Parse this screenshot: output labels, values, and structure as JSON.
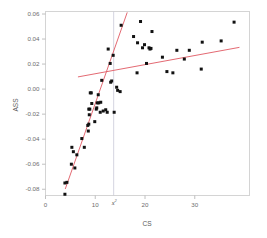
{
  "chart_data": {
    "type": "scatter",
    "title": "",
    "subtitle": "",
    "xlabel": "CS",
    "ylabel": "ASS",
    "xlim": [
      0,
      41
    ],
    "ylim": [
      -0.085,
      0.062
    ],
    "xticks": [
      0,
      10,
      20,
      30
    ],
    "xtick_labels": [
      "0",
      "10",
      "20",
      "30"
    ],
    "yticks": [
      0.06,
      0.04,
      0.02,
      0.0,
      -0.02,
      -0.04,
      -0.06,
      -0.08
    ],
    "ytick_labels": [
      "0.06",
      "0.04",
      "0.02",
      "0.00",
      "-0.02",
      "-0.04",
      "-0.06",
      "-0.08"
    ],
    "grid": false,
    "legend": null,
    "marker": {
      "shape": "square",
      "color": "#111111",
      "size": 3.0
    },
    "points": [
      {
        "x": 3.9,
        "y": -0.084
      },
      {
        "x": 3.9,
        "y": -0.075
      },
      {
        "x": 4.3,
        "y": -0.0745
      },
      {
        "x": 5.2,
        "y": -0.06
      },
      {
        "x": 5.3,
        "y": -0.0465
      },
      {
        "x": 5.6,
        "y": -0.05
      },
      {
        "x": 5.9,
        "y": -0.063
      },
      {
        "x": 6.3,
        "y": -0.0525
      },
      {
        "x": 7.3,
        "y": -0.0395
      },
      {
        "x": 7.8,
        "y": -0.0465
      },
      {
        "x": 8.5,
        "y": -0.029
      },
      {
        "x": 8.6,
        "y": -0.0335
      },
      {
        "x": 8.7,
        "y": -0.028
      },
      {
        "x": 8.7,
        "y": -0.016
      },
      {
        "x": 8.8,
        "y": -0.0205
      },
      {
        "x": 8.9,
        "y": -0.016
      },
      {
        "x": 9.0,
        "y": -0.003
      },
      {
        "x": 9.2,
        "y": -0.003
      },
      {
        "x": 9.3,
        "y": -0.0115
      },
      {
        "x": 9.9,
        "y": -0.026
      },
      {
        "x": 10.2,
        "y": -0.016
      },
      {
        "x": 10.3,
        "y": -0.015
      },
      {
        "x": 10.4,
        "y": -0.011
      },
      {
        "x": 10.6,
        "y": -0.0045
      },
      {
        "x": 10.7,
        "y": -0.011
      },
      {
        "x": 11.0,
        "y": -0.0185
      },
      {
        "x": 11.1,
        "y": -0.0105
      },
      {
        "x": 11.3,
        "y": 0.007
      },
      {
        "x": 11.6,
        "y": -0.0175
      },
      {
        "x": 12.1,
        "y": -0.0165
      },
      {
        "x": 12.4,
        "y": -0.0185
      },
      {
        "x": 12.6,
        "y": 0.032
      },
      {
        "x": 13.0,
        "y": 0.0205
      },
      {
        "x": 13.1,
        "y": 0.0055
      },
      {
        "x": 13.3,
        "y": 0.0065
      },
      {
        "x": 13.6,
        "y": 0.027
      },
      {
        "x": 13.8,
        "y": -0.0185
      },
      {
        "x": 14.3,
        "y": 0.0015
      },
      {
        "x": 14.5,
        "y": -0.001
      },
      {
        "x": 15.0,
        "y": -0.002
      },
      {
        "x": 15.2,
        "y": 0.051
      },
      {
        "x": 17.7,
        "y": 0.042
      },
      {
        "x": 18.4,
        "y": 0.013
      },
      {
        "x": 18.5,
        "y": 0.037
      },
      {
        "x": 19.1,
        "y": 0.054
      },
      {
        "x": 19.5,
        "y": 0.033
      },
      {
        "x": 19.9,
        "y": 0.0355
      },
      {
        "x": 20.3,
        "y": 0.0205
      },
      {
        "x": 20.8,
        "y": 0.033
      },
      {
        "x": 21.0,
        "y": 0.032
      },
      {
        "x": 21.2,
        "y": 0.0325
      },
      {
        "x": 21.4,
        "y": 0.046
      },
      {
        "x": 23.5,
        "y": 0.0255
      },
      {
        "x": 24.4,
        "y": 0.014
      },
      {
        "x": 25.6,
        "y": 0.013
      },
      {
        "x": 26.4,
        "y": 0.031
      },
      {
        "x": 27.9,
        "y": 0.024
      },
      {
        "x": 28.9,
        "y": 0.031
      },
      {
        "x": 31.3,
        "y": 0.016
      },
      {
        "x": 31.5,
        "y": 0.0375
      },
      {
        "x": 35.3,
        "y": 0.0385
      },
      {
        "x": 37.9,
        "y": 0.0535
      }
    ],
    "annotations": [
      {
        "name": "threshold-marker",
        "type": "vline",
        "x": 13.7,
        "label": "x",
        "label_superscript": "2",
        "color": "#c9c9d8"
      }
    ],
    "fit_lines": [
      {
        "name": "lower-segment-fit",
        "color": "#e2616a",
        "x_start": 4.0,
        "y_start": -0.0795,
        "x_end": 16.4,
        "y_end": 0.061
      },
      {
        "name": "upper-segment-fit",
        "color": "#e2616a",
        "x_start": 6.6,
        "y_start": 0.0098,
        "x_end": 38.9,
        "y_end": 0.0333
      }
    ]
  },
  "axes": {
    "x_title": "CS",
    "y_title": "ASS"
  }
}
